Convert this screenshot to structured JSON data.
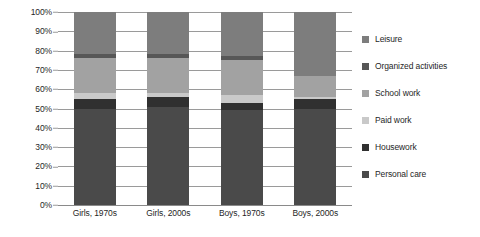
{
  "chart_data": {
    "type": "bar",
    "subtype": "stacked-100-percent",
    "title": "",
    "xlabel": "",
    "ylabel": "",
    "ylim": [
      0,
      100
    ],
    "y_ticks": [
      "0%",
      "10%",
      "20%",
      "30%",
      "40%",
      "50%",
      "60%",
      "70%",
      "80%",
      "90%",
      "100%"
    ],
    "grid": true,
    "legend_position": "right",
    "categories": [
      "Girls, 1970s",
      "Girls, 2000s",
      "Boys, 1970s",
      "Boys, 2000s"
    ],
    "series": [
      {
        "name": "Personal care",
        "color": "#4a4a4a",
        "values": [
          50,
          51,
          49,
          50
        ]
      },
      {
        "name": "Housework",
        "color": "#303030",
        "values": [
          5,
          5,
          4,
          5
        ]
      },
      {
        "name": "Paid work",
        "color": "#c9c9c9",
        "values": [
          3,
          2,
          4,
          1
        ]
      },
      {
        "name": "School work",
        "color": "#a2a2a2",
        "values": [
          18,
          18,
          18,
          11
        ]
      },
      {
        "name": "Organized activities",
        "color": "#575757",
        "values": [
          2,
          2,
          2,
          0
        ]
      },
      {
        "name": "Leisure",
        "color": "#7d7d7d",
        "values": [
          22,
          22,
          23,
          33
        ]
      }
    ]
  },
  "legend": {
    "items": [
      {
        "label": "Leisure",
        "color": "#7d7d7d"
      },
      {
        "label": "Organized activities",
        "color": "#575757"
      },
      {
        "label": "School work",
        "color": "#a2a2a2"
      },
      {
        "label": "Paid work",
        "color": "#c9c9c9"
      },
      {
        "label": "Housework",
        "color": "#303030"
      },
      {
        "label": "Personal care",
        "color": "#4a4a4a"
      }
    ]
  }
}
